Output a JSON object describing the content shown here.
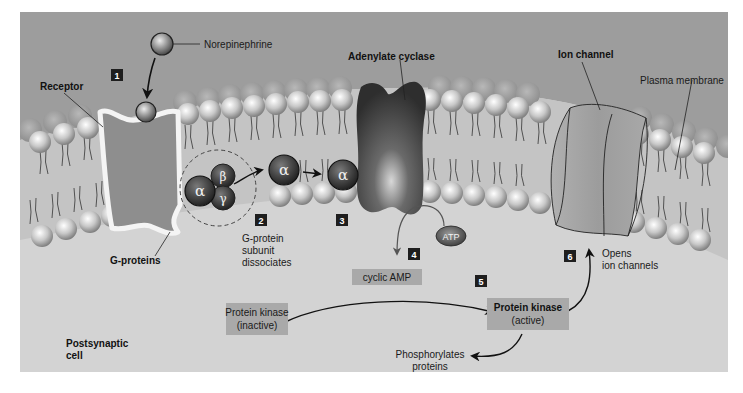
{
  "colors": {
    "extracellular": "#9a9a9a",
    "intracellular": "#d4d4d4",
    "membrane_band": "#c2c2c2",
    "head_light": "#f2f2f2",
    "head_dark": "#8a8a8a",
    "protein_dark": "#3a3a3a",
    "label_box": "#a8a8a8",
    "step_box": "#1e1e1e",
    "arrow": "#111111"
  },
  "labels": {
    "norepinephrine": "Norepinephrine",
    "receptor": "Receptor",
    "adenylate_cyclase": "Adenylate cyclase",
    "ion_channel": "Ion channel",
    "plasma_membrane": "Plasma membrane",
    "g_proteins": "G-proteins",
    "g_protein_dissociates": [
      "G-protein",
      "subunit",
      "dissociates"
    ],
    "atp": "ATP",
    "cyclic_amp": "cyclic AMP",
    "protein_kinase_inactive": [
      "Protein kinase",
      "(inactive)"
    ],
    "protein_kinase_active": [
      "Protein kinase",
      "(active)"
    ],
    "phosphorylates_proteins": [
      "Phosphorylates",
      "proteins"
    ],
    "opens_ion_channels": [
      "Opens",
      "ion channels"
    ],
    "postsynaptic_cell": [
      "Postsynaptic",
      "cell"
    ]
  },
  "subunits": {
    "alpha": "α",
    "beta": "β",
    "gamma": "γ"
  },
  "steps": [
    "1",
    "2",
    "3",
    "4",
    "5",
    "6"
  ]
}
